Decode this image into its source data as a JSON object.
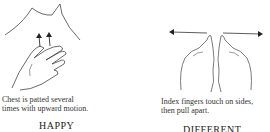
{
  "signs": [
    {
      "illustration": "hand-patting-chest",
      "caption_line1": "Chest is patted several",
      "caption_line2": "times with upward motion.",
      "word": "HAPPY"
    },
    {
      "illustration": "index-fingers-pulling-apart",
      "caption_line1": "Index fingers touch on sides,",
      "caption_line2": "then pull apart.",
      "word": "DIFFERENT"
    }
  ]
}
